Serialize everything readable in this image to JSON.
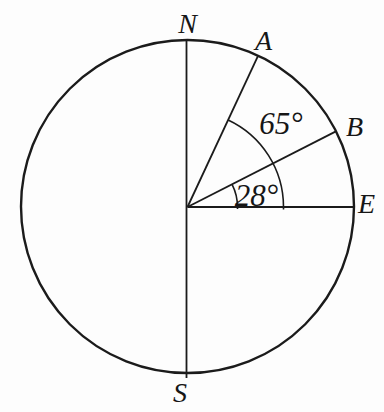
{
  "figure": {
    "type": "compass-bearing-circle-diagram",
    "colors": {
      "background": "#fdfdfd",
      "stroke": "#1b1b1b",
      "text": "#161616"
    },
    "labels": {
      "north": "N",
      "south": "S",
      "east": "E",
      "point_a": "A",
      "point_b": "B",
      "angle_a": "65°",
      "angle_b": "28°"
    },
    "angles": {
      "ray_a_from_east_deg": 65,
      "ray_b_from_east_deg": 28
    }
  }
}
